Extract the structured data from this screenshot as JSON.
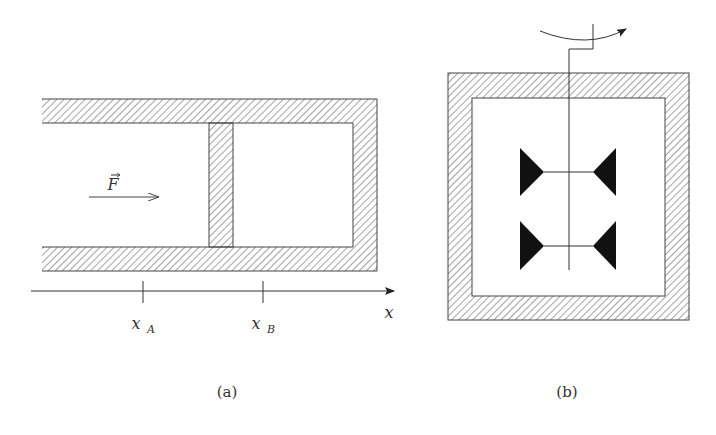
{
  "figure_a": {
    "caption": "(a)",
    "force_label": "F",
    "axis_label": "x",
    "tick_labels": [
      {
        "main": "x",
        "sub": "A"
      },
      {
        "main": "x",
        "sub": "B"
      }
    ]
  },
  "figure_b": {
    "caption": "(b)"
  },
  "colors": {
    "stroke": "#333333",
    "fill_dark": "#111111",
    "background": "#ffffff"
  }
}
